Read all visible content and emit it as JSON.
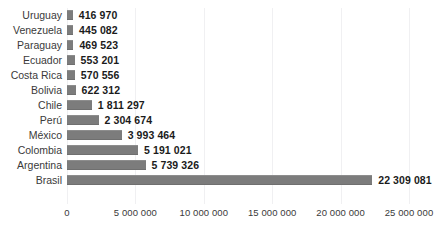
{
  "chart_data": {
    "type": "bar",
    "orientation": "horizontal",
    "title": "",
    "xlabel": "",
    "ylabel": "",
    "xlim": [
      0,
      25000000
    ],
    "grid": true,
    "legend": false,
    "bar_color": "#7c7c7c",
    "background_color": "#ffffff",
    "categories": [
      "Uruguay",
      "Venezuela",
      "Paraguay",
      "Ecuador",
      "Costa Rica",
      "Bolivia",
      "Chile",
      "Perú",
      "México",
      "Colombia",
      "Argentina",
      "Brasil"
    ],
    "values": [
      416970,
      445082,
      469523,
      553201,
      570556,
      622312,
      1811297,
      2304674,
      3993464,
      5191021,
      5739326,
      22309081
    ],
    "value_labels": [
      "416 970",
      "445 082",
      "469 523",
      "553 201",
      "570 556",
      "622 312",
      "1 811 297",
      "2 304 674",
      "3 993 464",
      "5 191 021",
      "5 739 326",
      "22 309 081"
    ],
    "xticks": [
      0,
      5000000,
      10000000,
      15000000,
      20000000,
      25000000
    ],
    "xtick_labels": [
      "0",
      "5 000 000",
      "10 000 000",
      "15 000 000",
      "20 000 000",
      "25 000 000"
    ]
  },
  "title_sliver": ""
}
